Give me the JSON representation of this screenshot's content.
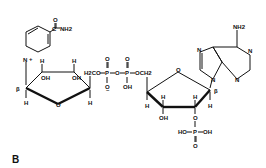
{
  "figure": {
    "panel_label": "B",
    "molecule": "NADP+",
    "nicotinamide": {
      "ring_n": "N",
      "charge": "+",
      "carbonyl_o": "O",
      "amide": "C",
      "nh2": "NH2"
    },
    "ribose1": {
      "h_top_left": "H",
      "h_top_right": "H",
      "oh_left": "OH",
      "oh_right": "OH",
      "ring_o": "O",
      "beta": "β",
      "h_bottom_left": "H",
      "h_bottom_right": "H"
    },
    "pyrophosphate": {
      "h2co": "H2CO",
      "p1": "P",
      "p2": "P",
      "o_bridge": "O",
      "o_top1": "O",
      "o_top2": "O",
      "o_minus": "O",
      "minus": "–",
      "oh": "OH",
      "och2": "OCH2"
    },
    "ribose2": {
      "ring_o": "O",
      "beta": "β",
      "h1": "H",
      "h2": "H",
      "h3": "H",
      "h4": "H",
      "h5": "H",
      "oh": "OH",
      "o_phos": "O"
    },
    "phosphate": {
      "ho": "HO",
      "p": "P",
      "oh": "OH",
      "o": "O"
    },
    "adenine": {
      "nh2": "NH2",
      "n1": "N",
      "n2": "N",
      "n3": "N",
      "n4": "N"
    }
  }
}
